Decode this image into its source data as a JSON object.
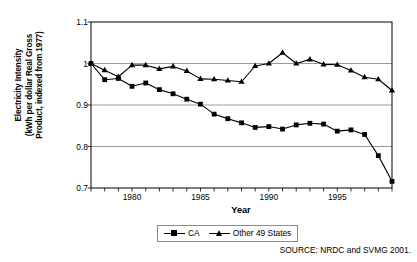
{
  "chart_data": {
    "type": "line",
    "title": "",
    "xlabel": "Year",
    "ylabel": "Electricity Intensity (kWh per dollar Real Gross Product, indexed from 1977)",
    "ylabel_lines": [
      "Electricity Intensity",
      "(kWh per dollar Real Gross",
      "Product, indexed from 1977)"
    ],
    "ylim": [
      0.7,
      1.1
    ],
    "yticks": [
      0.7,
      0.8,
      0.9,
      1,
      1.1
    ],
    "ytick_labels": [
      "0.7",
      "0.8",
      "0.9",
      "1",
      "1.1"
    ],
    "xlim": [
      1977,
      1999
    ],
    "xticks": [
      1980,
      1985,
      1990,
      1995
    ],
    "xtick_labels": [
      "1980",
      "1985",
      "1990",
      "1995"
    ],
    "x": [
      1977,
      1978,
      1979,
      1980,
      1981,
      1982,
      1983,
      1984,
      1985,
      1986,
      1987,
      1988,
      1989,
      1990,
      1991,
      1992,
      1993,
      1994,
      1995,
      1996,
      1997,
      1998,
      1999
    ],
    "grid": "horizontal",
    "legend_position": "bottom",
    "series": [
      {
        "name": "CA",
        "marker": "square",
        "values": [
          1.0,
          0.961,
          0.964,
          0.945,
          0.953,
          0.937,
          0.927,
          0.914,
          0.902,
          0.878,
          0.867,
          0.857,
          0.846,
          0.848,
          0.842,
          0.852,
          0.856,
          0.854,
          0.837,
          0.84,
          0.829,
          0.778,
          0.716
        ]
      },
      {
        "name": "Other 49 States",
        "marker": "triangle",
        "values": [
          1.0,
          0.984,
          0.968,
          0.996,
          0.996,
          0.987,
          0.993,
          0.982,
          0.963,
          0.962,
          0.959,
          0.956,
          0.994,
          1.0,
          1.026,
          1.0,
          1.01,
          0.998,
          0.997,
          0.983,
          0.967,
          0.962,
          0.935
        ]
      }
    ]
  },
  "legend": {
    "items": [
      {
        "label": "CA",
        "marker": "square"
      },
      {
        "label": "Other 49 States",
        "marker": "triangle"
      }
    ]
  },
  "source_note": "SOURCE: NRDC and SVMG 2001."
}
